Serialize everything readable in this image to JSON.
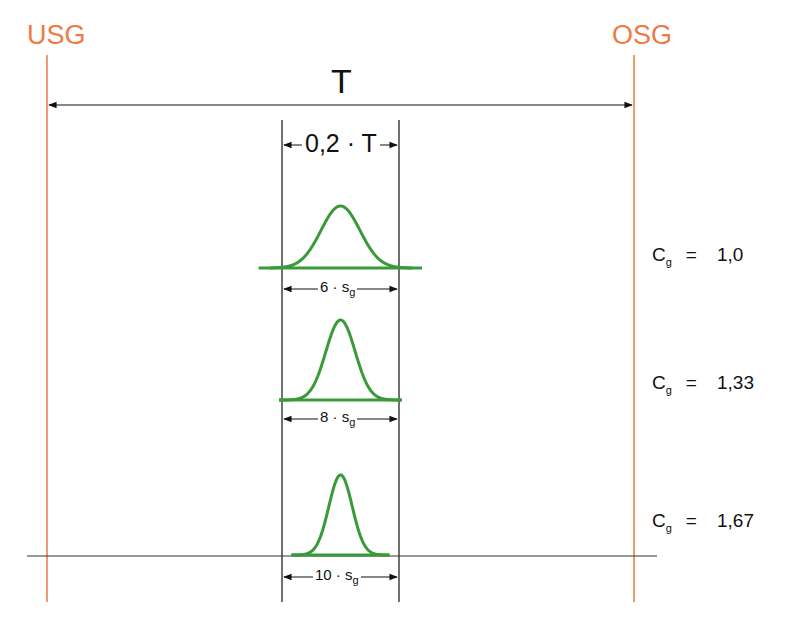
{
  "labels": {
    "lower_limit": "USG",
    "upper_limit": "OSG",
    "tolerance": "T",
    "tolerance_fraction": "0,2 · T",
    "cg_symbol": "C",
    "cg_subscript": "g",
    "equals": "="
  },
  "colors": {
    "limit_lines": "#ee7a45",
    "curves": "#3a9a3a",
    "lines": "#111111"
  },
  "cases": [
    {
      "spread_label": "6 · s",
      "spread_subscript": "g",
      "sigma_multiple": 6,
      "cg_value": "1,0"
    },
    {
      "spread_label": "8 · s",
      "spread_subscript": "g",
      "sigma_multiple": 8,
      "cg_value": "1,33"
    },
    {
      "spread_label": "10 · s",
      "spread_subscript": "g",
      "sigma_multiple": 10,
      "cg_value": "1,67"
    }
  ]
}
